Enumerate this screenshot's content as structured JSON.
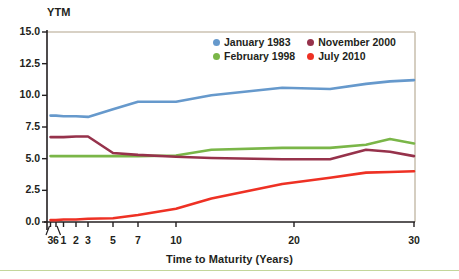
{
  "figure": {
    "y_axis_title": "YTM",
    "x_axis_title": "Time to Maturity (Years)"
  },
  "colors": {
    "january_1983": "#6699cc",
    "february_1998": "#7ab648",
    "november_2000": "#96324b",
    "july_2010": "#ee3124",
    "axis": "#231f20",
    "frame": "#cbc2b2",
    "rule": "#c3d69b"
  },
  "chart_data": {
    "type": "line",
    "title": "",
    "xlabel": "Time to Maturity (Years)",
    "ylabel": "YTM",
    "ylim": [
      0.0,
      15.0
    ],
    "yticks": [
      0.0,
      2.5,
      5.0,
      7.5,
      10.0,
      12.5,
      15.0
    ],
    "ytick_labels": [
      "0.0",
      "2.5",
      "5.0",
      "7.5",
      "10.0",
      "12.5",
      "15.0"
    ],
    "xtick_labels": [
      "3",
      "6",
      "1",
      "2",
      "3",
      "5",
      "7",
      "10",
      "20",
      "30"
    ],
    "xtick_note_months": [
      "3",
      "6"
    ],
    "x": [
      0.25,
      0.5,
      1,
      2,
      3,
      5,
      7,
      10,
      13,
      19,
      23,
      26,
      28,
      30
    ],
    "grid": false,
    "legend_position": "top-right",
    "series": [
      {
        "name": "January 1983",
        "color": "#6699cc",
        "values": [
          8.4,
          8.4,
          8.35,
          8.35,
          8.3,
          8.9,
          9.5,
          9.5,
          10.0,
          10.6,
          10.5,
          10.9,
          11.1,
          11.2
        ]
      },
      {
        "name": "February 1998",
        "color": "#7ab648",
        "values": [
          5.2,
          5.2,
          5.2,
          5.2,
          5.2,
          5.2,
          5.2,
          5.25,
          5.7,
          5.85,
          5.85,
          6.1,
          6.55,
          6.2
        ]
      },
      {
        "name": "November 2000",
        "color": "#96324b",
        "values": [
          6.7,
          6.7,
          6.7,
          6.75,
          6.75,
          5.45,
          5.3,
          5.15,
          5.05,
          4.95,
          4.95,
          5.7,
          5.55,
          5.2
        ]
      },
      {
        "name": "July 2010",
        "color": "#ee3124",
        "values": [
          0.15,
          0.15,
          0.2,
          0.2,
          0.25,
          0.3,
          0.55,
          1.05,
          1.85,
          3.0,
          3.5,
          3.9,
          3.95,
          4.0
        ]
      }
    ]
  },
  "legend": {
    "entries": [
      {
        "label": "January 1983",
        "color": "#6699cc"
      },
      {
        "label": "November 2000",
        "color": "#96324b"
      },
      {
        "label": "February 1998",
        "color": "#7ab648"
      },
      {
        "label": "July 2010",
        "color": "#ee3124"
      }
    ]
  }
}
